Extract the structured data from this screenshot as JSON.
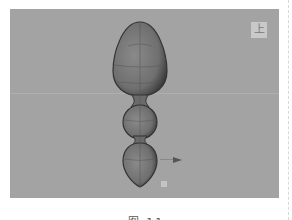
{
  "viewport": {
    "view_label": "上",
    "background_color": "#a3a3a3",
    "object": "three-segment egg-shaped wireframe model (snowman-like)"
  },
  "gizmo": {
    "x_arrow": "right-arrow",
    "y_arrow": "down-arrow",
    "pivot": "pivot-square"
  },
  "caption": "图 11"
}
